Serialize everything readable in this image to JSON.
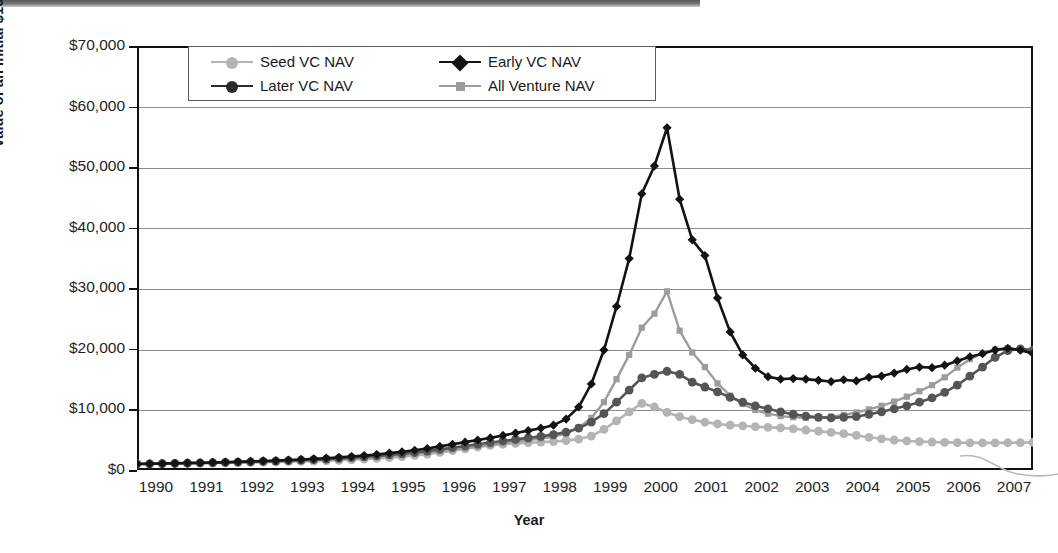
{
  "chart_data": {
    "type": "line",
    "title": "",
    "xlabel": "Year",
    "ylabel": "Value of an Initial $1000",
    "xlim": [
      1990,
      2007.75
    ],
    "ylim": [
      0,
      70000
    ],
    "grid": true,
    "legend_position": "top-left-inside",
    "x_tick_labels": [
      "1990",
      "1991",
      "1992",
      "1993",
      "1994",
      "1995",
      "1996",
      "1997",
      "1998",
      "1999",
      "2000",
      "2001",
      "2002",
      "2003",
      "2004",
      "2005",
      "2006",
      "2007"
    ],
    "y_tick_labels": [
      "$0",
      "$10,000",
      "$20,000",
      "$30,000",
      "$40,000",
      "$50,000",
      "$60,000",
      "$70,000"
    ],
    "y_tick_values": [
      0,
      10000,
      20000,
      30000,
      40000,
      50000,
      60000,
      70000
    ],
    "x": [
      1990,
      1990.25,
      1990.5,
      1990.75,
      1991,
      1991.25,
      1991.5,
      1991.75,
      1992,
      1992.25,
      1992.5,
      1992.75,
      1993,
      1993.25,
      1993.5,
      1993.75,
      1994,
      1994.25,
      1994.5,
      1994.75,
      1995,
      1995.25,
      1995.5,
      1995.75,
      1996,
      1996.25,
      1996.5,
      1996.75,
      1997,
      1997.25,
      1997.5,
      1997.75,
      1998,
      1998.25,
      1998.5,
      1998.75,
      1999,
      1999.25,
      1999.5,
      1999.75,
      2000,
      2000.25,
      2000.5,
      2000.75,
      2001,
      2001.25,
      2001.5,
      2001.75,
      2002,
      2002.25,
      2002.5,
      2002.75,
      2003,
      2003.25,
      2003.5,
      2003.75,
      2004,
      2004.25,
      2004.5,
      2004.75,
      2005,
      2005.25,
      2005.5,
      2005.75,
      2006,
      2006.25,
      2006.5,
      2006.75,
      2007,
      2007.25,
      2007.5,
      2007.75
    ],
    "series": [
      {
        "name": "Seed  VC NAV",
        "color": "#b4b4b4",
        "marker": "circle",
        "values": [
          1000,
          1020,
          1040,
          1070,
          1100,
          1120,
          1150,
          1180,
          1220,
          1250,
          1290,
          1330,
          1380,
          1420,
          1470,
          1520,
          1600,
          1680,
          1780,
          1900,
          2050,
          2200,
          2400,
          2600,
          2900,
          3200,
          3500,
          3800,
          4050,
          4250,
          4400,
          4500,
          4600,
          4700,
          4850,
          5100,
          5600,
          6700,
          8100,
          9600,
          11000,
          10400,
          9500,
          8800,
          8300,
          7900,
          7600,
          7400,
          7300,
          7150,
          7050,
          6950,
          6800,
          6600,
          6400,
          6200,
          6000,
          5700,
          5400,
          5150,
          4950,
          4800,
          4700,
          4620,
          4560,
          4520,
          4490,
          4470,
          4480,
          4500,
          4520,
          4560
        ]
      },
      {
        "name": "Early  VC NAV",
        "color": "#131313",
        "marker": "diamond",
        "values": [
          1000,
          1030,
          1070,
          1110,
          1160,
          1200,
          1250,
          1300,
          1360,
          1420,
          1490,
          1560,
          1650,
          1740,
          1840,
          1950,
          2080,
          2220,
          2380,
          2560,
          2780,
          3000,
          3260,
          3550,
          3900,
          4250,
          4600,
          4950,
          5300,
          5700,
          6100,
          6500,
          6900,
          7400,
          8400,
          10400,
          14200,
          19800,
          27000,
          34900,
          45600,
          50200,
          56500,
          44700,
          38000,
          35400,
          28400,
          22800,
          19000,
          16800,
          15400,
          15000,
          15100,
          15000,
          14800,
          14600,
          14900,
          14700,
          15300,
          15500,
          16000,
          16600,
          17000,
          16900,
          17300,
          18000,
          18700,
          19200,
          19800,
          20100,
          19800,
          19200
        ]
      },
      {
        "name": "Later  VC NAV",
        "color": "#555555",
        "marker": "circle",
        "values": [
          1000,
          1025,
          1055,
          1090,
          1130,
          1165,
          1205,
          1250,
          1300,
          1350,
          1410,
          1470,
          1545,
          1620,
          1705,
          1800,
          1910,
          2030,
          2170,
          2320,
          2500,
          2680,
          2890,
          3120,
          3400,
          3680,
          3960,
          4250,
          4530,
          4800,
          5050,
          5300,
          5550,
          5850,
          6250,
          6900,
          7900,
          9300,
          11200,
          13200,
          15200,
          15800,
          16300,
          15800,
          14500,
          13700,
          12900,
          12000,
          11200,
          10600,
          10100,
          9600,
          9200,
          8900,
          8700,
          8600,
          8700,
          8800,
          9200,
          9600,
          10100,
          10600,
          11200,
          11900,
          12800,
          14000,
          15500,
          17000,
          18600,
          19700,
          20000,
          19800
        ]
      },
      {
        "name": "All Venture NAV",
        "color": "#9c9c9c",
        "marker": "square",
        "values": [
          1000,
          1020,
          1050,
          1080,
          1115,
          1150,
          1185,
          1225,
          1270,
          1315,
          1370,
          1425,
          1490,
          1560,
          1640,
          1720,
          1820,
          1930,
          2050,
          2190,
          2340,
          2500,
          2690,
          2890,
          3130,
          3380,
          3630,
          3900,
          4170,
          4430,
          4680,
          4930,
          5180,
          5500,
          6000,
          7000,
          8600,
          11200,
          15000,
          19000,
          23500,
          25800,
          29500,
          23000,
          19400,
          17000,
          14300,
          12300,
          10900,
          9900,
          9300,
          8900,
          8700,
          8600,
          8650,
          8800,
          9100,
          9500,
          10000,
          10600,
          11300,
          12100,
          13000,
          14000,
          15300,
          16900,
          18300,
          19300,
          19900,
          20100,
          19900,
          19600
        ]
      }
    ]
  },
  "axes": {
    "y_title": "Value of an Initial $1000",
    "x_title": "Year"
  },
  "legend": {
    "entries": [
      {
        "label": "Seed  VC NAV",
        "color": "#b4b4b4",
        "marker": "circle"
      },
      {
        "label": "Early  VC NAV",
        "color": "#131313",
        "marker": "diamond"
      },
      {
        "label": "Later  VC NAV",
        "color": "#2b2b2b",
        "marker": "circle"
      },
      {
        "label": "All Venture NAV",
        "color": "#9c9c9c",
        "marker": "square"
      }
    ]
  }
}
